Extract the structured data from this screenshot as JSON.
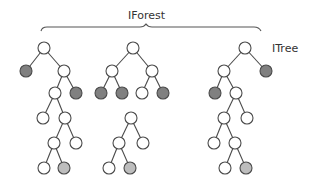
{
  "labels": {
    "forest": "IForest",
    "tree": "ITree"
  },
  "colors": {
    "node_white": "#ffffff",
    "node_dark": "#808080",
    "node_light": "#bdbdbd",
    "stroke": "#4a4a4a"
  },
  "node_radius": 6,
  "trees": [
    {
      "name": "tree-1",
      "nodes": [
        {
          "id": "a",
          "x": 44,
          "y": 48,
          "fill": "white"
        },
        {
          "id": "b",
          "x": 26,
          "y": 71,
          "fill": "dark"
        },
        {
          "id": "c",
          "x": 64,
          "y": 71,
          "fill": "white"
        },
        {
          "id": "d",
          "x": 55,
          "y": 93,
          "fill": "white"
        },
        {
          "id": "e",
          "x": 76,
          "y": 93,
          "fill": "dark"
        },
        {
          "id": "f",
          "x": 43,
          "y": 118,
          "fill": "white"
        },
        {
          "id": "g",
          "x": 65,
          "y": 118,
          "fill": "white"
        },
        {
          "id": "h",
          "x": 54,
          "y": 143,
          "fill": "white"
        },
        {
          "id": "i",
          "x": 76,
          "y": 143,
          "fill": "white"
        },
        {
          "id": "j",
          "x": 44,
          "y": 168,
          "fill": "white"
        },
        {
          "id": "k",
          "x": 64,
          "y": 168,
          "fill": "light"
        }
      ],
      "edges": [
        [
          "a",
          "b"
        ],
        [
          "a",
          "c"
        ],
        [
          "c",
          "d"
        ],
        [
          "c",
          "e"
        ],
        [
          "d",
          "f"
        ],
        [
          "d",
          "g"
        ],
        [
          "g",
          "h"
        ],
        [
          "g",
          "i"
        ],
        [
          "h",
          "j"
        ],
        [
          "h",
          "k"
        ]
      ]
    },
    {
      "name": "tree-2",
      "nodes": [
        {
          "id": "a",
          "x": 133,
          "y": 48,
          "fill": "white"
        },
        {
          "id": "b",
          "x": 112,
          "y": 71,
          "fill": "white"
        },
        {
          "id": "c",
          "x": 152,
          "y": 71,
          "fill": "white"
        },
        {
          "id": "d",
          "x": 101,
          "y": 93,
          "fill": "dark"
        },
        {
          "id": "e",
          "x": 122,
          "y": 93,
          "fill": "dark"
        },
        {
          "id": "f",
          "x": 142,
          "y": 93,
          "fill": "white"
        },
        {
          "id": "g",
          "x": 163,
          "y": 93,
          "fill": "dark"
        },
        {
          "id": "h",
          "x": 131,
          "y": 118,
          "fill": "white"
        },
        {
          "id": "i",
          "x": 119,
          "y": 143,
          "fill": "white"
        },
        {
          "id": "j",
          "x": 143,
          "y": 143,
          "fill": "white"
        },
        {
          "id": "k",
          "x": 109,
          "y": 168,
          "fill": "white"
        },
        {
          "id": "l",
          "x": 130,
          "y": 168,
          "fill": "light"
        }
      ],
      "edges": [
        [
          "a",
          "b"
        ],
        [
          "a",
          "c"
        ],
        [
          "b",
          "d"
        ],
        [
          "b",
          "e"
        ],
        [
          "c",
          "f"
        ],
        [
          "c",
          "g"
        ],
        [
          "h",
          "i"
        ],
        [
          "h",
          "j"
        ],
        [
          "i",
          "k"
        ],
        [
          "i",
          "l"
        ]
      ]
    },
    {
      "name": "tree-3",
      "nodes": [
        {
          "id": "a",
          "x": 245,
          "y": 48,
          "fill": "white"
        },
        {
          "id": "b",
          "x": 224,
          "y": 71,
          "fill": "white"
        },
        {
          "id": "c",
          "x": 266,
          "y": 71,
          "fill": "dark"
        },
        {
          "id": "d",
          "x": 215,
          "y": 93,
          "fill": "dark"
        },
        {
          "id": "e",
          "x": 236,
          "y": 93,
          "fill": "white"
        },
        {
          "id": "f",
          "x": 224,
          "y": 118,
          "fill": "white"
        },
        {
          "id": "g",
          "x": 247,
          "y": 118,
          "fill": "white"
        },
        {
          "id": "h",
          "x": 214,
          "y": 143,
          "fill": "white"
        },
        {
          "id": "i",
          "x": 235,
          "y": 143,
          "fill": "white"
        },
        {
          "id": "j",
          "x": 225,
          "y": 168,
          "fill": "white"
        },
        {
          "id": "k",
          "x": 246,
          "y": 168,
          "fill": "light"
        }
      ],
      "edges": [
        [
          "a",
          "b"
        ],
        [
          "a",
          "c"
        ],
        [
          "b",
          "d"
        ],
        [
          "b",
          "e"
        ],
        [
          "e",
          "f"
        ],
        [
          "e",
          "g"
        ],
        [
          "f",
          "h"
        ],
        [
          "f",
          "i"
        ],
        [
          "i",
          "j"
        ],
        [
          "i",
          "k"
        ]
      ]
    }
  ]
}
